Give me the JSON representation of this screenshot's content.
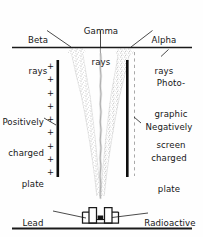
{
  "figure": {
    "kind": "physics-diagram",
    "ink_color": "#161616",
    "plate_color": "#0d0d0d",
    "beam_stipple_color": "#b9b9b9",
    "gamma_line_color": "#9a9a9a"
  },
  "labels": {
    "beta_rays": {
      "line1": "Beta",
      "line2": "rays"
    },
    "gamma_rays": {
      "line1": "Gamma",
      "line2": "rays"
    },
    "alpha_rays": {
      "line1": "Alpha",
      "line2": "rays"
    },
    "photographic_screen": {
      "line1": "Photo-",
      "line2": "graphic",
      "line3": "screen"
    },
    "positively_charged_plate": {
      "line1": "Positively",
      "line2": "charged",
      "line3": "plate"
    },
    "negatively_charged_plate": {
      "line1": "Negatively",
      "line2": "charged",
      "line3": "plate"
    },
    "lead_container": {
      "line1": "Lead",
      "line2": "container"
    },
    "radioactive_substances": {
      "line1": "Radioactive",
      "line2": "substances"
    }
  },
  "charges": {
    "positive_symbol": "+",
    "positive_count": 9,
    "negative_symbol": "–",
    "negative_count": 0
  },
  "components": [
    {
      "name": "photographic-screen",
      "type": "horizontal-line"
    },
    {
      "name": "positive-plate",
      "type": "vertical-bar"
    },
    {
      "name": "negative-plate",
      "type": "vertical-bar"
    },
    {
      "name": "beta-beam",
      "type": "stippled-beam",
      "deflection": "left"
    },
    {
      "name": "gamma-beam",
      "type": "wavy-line",
      "deflection": "none"
    },
    {
      "name": "alpha-beam",
      "type": "stippled-beam",
      "deflection": "right"
    },
    {
      "name": "lead-container",
      "type": "box-with-channel"
    },
    {
      "name": "radioactive-source",
      "type": "filled-square"
    },
    {
      "name": "ground-baseline",
      "type": "horizontal-line"
    }
  ]
}
